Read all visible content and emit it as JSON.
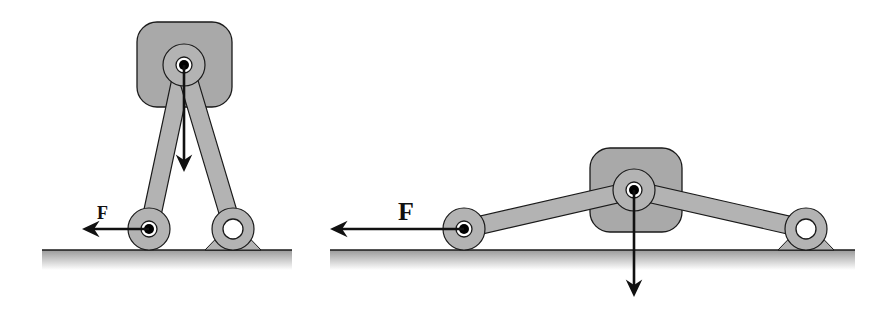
{
  "diagram": {
    "type": "mechanism",
    "colors": {
      "body_fill": "#a9a9a9",
      "link_fill": "#b3b3b3",
      "stroke": "#1a1a1a",
      "ground_top": "#9a9a9a",
      "ground_bottom": "#ffffff",
      "arrow": "#111111",
      "pin_hole": "#ffffff",
      "pin_dot": "#000000"
    },
    "figures": [
      {
        "id": "left",
        "configuration": "steep toggle linkage (links nearly vertical)",
        "force_label": "F",
        "force_label_size": 18,
        "block": {
          "x": 137,
          "y": 22,
          "w": 95,
          "h": 85,
          "r": 20
        },
        "top_pin": {
          "x": 184,
          "y": 65
        },
        "roller_pin": {
          "x": 149,
          "y": 229
        },
        "fixed_pin": {
          "x": 233,
          "y": 229
        },
        "ground": {
          "x1": 42,
          "x2": 292,
          "y": 250
        },
        "force_arrow": {
          "x1": 149,
          "x2": 82,
          "y": 229
        },
        "force_label_pos": {
          "x": 97,
          "y": 219
        },
        "load_arrow": {
          "x": 184,
          "y1": 65,
          "y2": 172
        }
      },
      {
        "id": "right",
        "configuration": "shallow toggle linkage (links nearly horizontal)",
        "force_label": "F",
        "force_label_size": 26,
        "block": {
          "x": 590,
          "y": 148,
          "w": 92,
          "h": 84,
          "r": 20
        },
        "top_pin": {
          "x": 634,
          "y": 190
        },
        "roller_pin": {
          "x": 464,
          "y": 229
        },
        "fixed_pin": {
          "x": 806,
          "y": 229
        },
        "ground": {
          "x1": 330,
          "x2": 855,
          "y": 250
        },
        "force_arrow": {
          "x1": 464,
          "x2": 330,
          "y": 229
        },
        "force_label_pos": {
          "x": 398,
          "y": 220
        },
        "load_arrow": {
          "x": 634,
          "y1": 190,
          "y2": 297
        }
      }
    ]
  }
}
